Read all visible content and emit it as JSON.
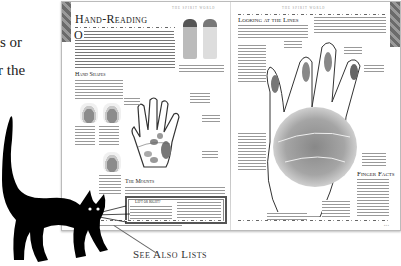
{
  "side_text": {
    "line1": "s or",
    "line2": "r the"
  },
  "left_page": {
    "running_head": "THE SPIRIT WORLD",
    "title": "Hand-Reading",
    "intro_dropcap": "O",
    "sections": [
      {
        "heading": "Hand Shapes"
      },
      {
        "heading": "The Mounts"
      }
    ],
    "boxout": {
      "heading": "Left or Right?"
    },
    "figures": [
      "hand-shape-1",
      "hand-shape-2",
      "hand-shape-3",
      "hand-shape-4"
    ],
    "footer_ref": "See also lists"
  },
  "right_page": {
    "running_head": "THE SPIRIT WORLD",
    "title": "Looking at the Lines",
    "sections": [
      {
        "heading": "Finger Facts"
      }
    ]
  },
  "annotation": {
    "label": "See Also Lists"
  },
  "colors": {
    "ornament": "#7a7a7a",
    "text": "#222222",
    "rule": "#666666"
  }
}
